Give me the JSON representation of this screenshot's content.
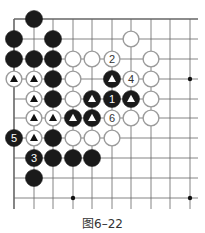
{
  "diagram": {
    "caption": "图6–22",
    "grid": {
      "col_x": [
        14,
        34,
        53,
        73,
        92,
        112,
        131,
        151,
        170,
        190
      ],
      "row_y": [
        19,
        39,
        59,
        79,
        99,
        118,
        138,
        158,
        178,
        198
      ],
      "right_extent": 198,
      "bottom_extent": 209,
      "top_edge": true,
      "left_edge": true
    },
    "colors": {
      "black_stone": "#1a1a1a",
      "white_stone_fill": "#ffffff",
      "white_stone_stroke": "#9a9a9a",
      "line": "#666666"
    },
    "star_points": [
      {
        "c": 9,
        "r": 3
      },
      {
        "c": 3,
        "r": 9
      },
      {
        "c": 9,
        "r": 9
      }
    ],
    "stones": [
      {
        "c": 1,
        "r": 0,
        "color": "black"
      },
      {
        "c": 0,
        "r": 1,
        "color": "black"
      },
      {
        "c": 2,
        "r": 1,
        "color": "black"
      },
      {
        "c": 6,
        "r": 1,
        "color": "white"
      },
      {
        "c": 0,
        "r": 2,
        "color": "black"
      },
      {
        "c": 1,
        "r": 2,
        "color": "black"
      },
      {
        "c": 2,
        "r": 2,
        "color": "black"
      },
      {
        "c": 3,
        "r": 2,
        "color": "white"
      },
      {
        "c": 4,
        "r": 2,
        "color": "white"
      },
      {
        "c": 5,
        "r": 2,
        "color": "white",
        "label": "2"
      },
      {
        "c": 7,
        "r": 2,
        "color": "white"
      },
      {
        "c": 0,
        "r": 3,
        "color": "white",
        "mark": "triangle"
      },
      {
        "c": 1,
        "r": 3,
        "color": "white",
        "mark": "triangle"
      },
      {
        "c": 2,
        "r": 3,
        "color": "black"
      },
      {
        "c": 3,
        "r": 3,
        "color": "white"
      },
      {
        "c": 5,
        "r": 3,
        "color": "black",
        "mark": "triangle"
      },
      {
        "c": 6,
        "r": 3,
        "color": "white",
        "label": "4"
      },
      {
        "c": 7,
        "r": 3,
        "color": "white"
      },
      {
        "c": 1,
        "r": 4,
        "color": "white",
        "mark": "triangle"
      },
      {
        "c": 2,
        "r": 4,
        "color": "black"
      },
      {
        "c": 3,
        "r": 4,
        "color": "white"
      },
      {
        "c": 4,
        "r": 4,
        "color": "black",
        "mark": "triangle"
      },
      {
        "c": 5,
        "r": 4,
        "color": "black",
        "label": "1"
      },
      {
        "c": 6,
        "r": 4,
        "color": "black",
        "mark": "triangle"
      },
      {
        "c": 7,
        "r": 4,
        "color": "white"
      },
      {
        "c": 1,
        "r": 5,
        "color": "white",
        "mark": "triangle"
      },
      {
        "c": 2,
        "r": 5,
        "color": "white",
        "mark": "triangle"
      },
      {
        "c": 3,
        "r": 5,
        "color": "black",
        "mark": "triangle"
      },
      {
        "c": 4,
        "r": 5,
        "color": "black",
        "mark": "triangle"
      },
      {
        "c": 5,
        "r": 5,
        "color": "white",
        "label": "6"
      },
      {
        "c": 6,
        "r": 5,
        "color": "white"
      },
      {
        "c": 7,
        "r": 5,
        "color": "white"
      },
      {
        "c": 0,
        "r": 6,
        "color": "black",
        "label": "5"
      },
      {
        "c": 1,
        "r": 6,
        "color": "white",
        "mark": "triangle"
      },
      {
        "c": 2,
        "r": 6,
        "color": "black"
      },
      {
        "c": 3,
        "r": 6,
        "color": "white"
      },
      {
        "c": 4,
        "r": 6,
        "color": "white"
      },
      {
        "c": 5,
        "r": 6,
        "color": "white"
      },
      {
        "c": 1,
        "r": 7,
        "color": "black",
        "label": "3"
      },
      {
        "c": 2,
        "r": 7,
        "color": "black"
      },
      {
        "c": 3,
        "r": 7,
        "color": "black"
      },
      {
        "c": 4,
        "r": 7,
        "color": "black"
      },
      {
        "c": 1,
        "r": 8,
        "color": "black"
      }
    ]
  }
}
